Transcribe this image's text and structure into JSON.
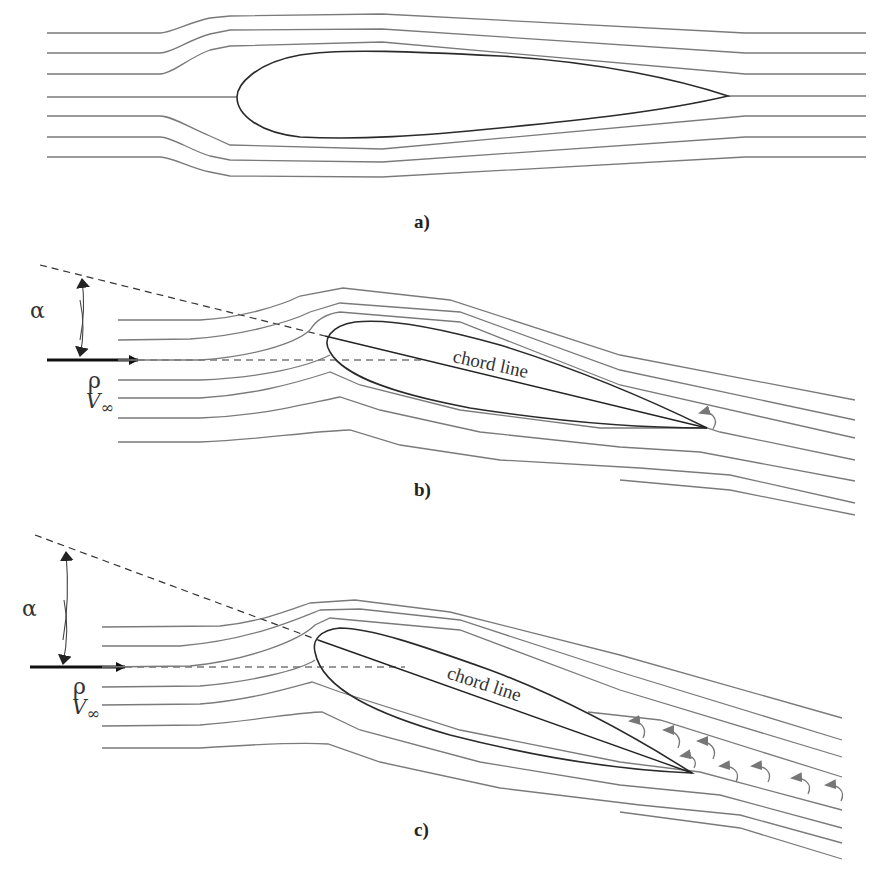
{
  "figure": {
    "panels": [
      {
        "id": "a",
        "label": "a)",
        "description": "Airfoil at zero angle of attack with symmetric streamlines"
      },
      {
        "id": "b",
        "label": "b)",
        "description": "Airfoil at angle of attack with attached flow",
        "alpha_symbol": "α",
        "density_symbol": "ρ",
        "velocity_symbol": "V",
        "velocity_subscript": "∞",
        "chord_label": "chord line"
      },
      {
        "id": "c",
        "label": "c)",
        "description": "Airfoil at high angle of attack with flow separation and vortices in wake",
        "alpha_symbol": "α",
        "density_symbol": "ρ",
        "velocity_symbol": "V",
        "velocity_subscript": "∞",
        "chord_label": "chord line"
      }
    ],
    "colors": {
      "streamline": "#7a7a7a",
      "airfoil": "#2a2a2a",
      "arrow": "#111111",
      "background": "#ffffff"
    }
  }
}
